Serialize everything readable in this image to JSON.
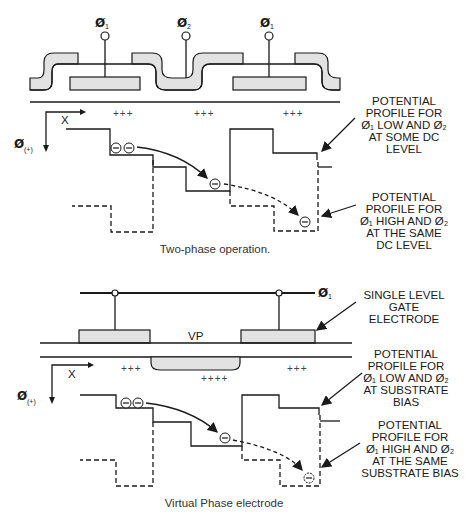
{
  "figure": {
    "top": {
      "caption": "Two-phase operation.",
      "electrodes": [
        {
          "label": "Ø",
          "sub": "1"
        },
        {
          "label": "Ø",
          "sub": "2"
        },
        {
          "label": "Ø",
          "sub": "1"
        }
      ],
      "charges": [
        "+++",
        "+++",
        "+++"
      ],
      "axis": {
        "x_label": "X",
        "y_label": "Ø",
        "y_sub": "(+)"
      },
      "annotations": [
        {
          "lines": [
            "POTENTIAL",
            "PROFILE FOR",
            "Ø₁ LOW AND Ø₂",
            "AT SOME DC",
            "LEVEL"
          ]
        },
        {
          "lines": [
            "POTENTIAL",
            "PROFILE FOR",
            "Ø₁ HIGH AND Ø₂",
            "AT THE SAME",
            "DC LEVEL"
          ]
        }
      ],
      "electron_symbol": "⊖"
    },
    "bottom": {
      "caption": "Virtual Phase electrode",
      "clock": {
        "label": "Ø",
        "sub": "1"
      },
      "vp_label": "VP",
      "charges": [
        "+++",
        "++++",
        "+++"
      ],
      "axis": {
        "x_label": "X",
        "y_label": "Ø",
        "y_sub": "(+)"
      },
      "annotations": [
        {
          "lines": [
            "SINGLE LEVEL",
            "GATE",
            "ELECTRODE"
          ]
        },
        {
          "lines": [
            "POTENTIAL",
            "PROFILE FOR",
            "Ø₁ LOW AND Ø₂",
            "AT SUBSTRATE",
            "BIAS"
          ]
        },
        {
          "lines": [
            "POTENTIAL",
            "PROFILE FOR",
            "Ø₁ HIGH AND Ø₂",
            "AT THE SAME",
            "SUBSTRATE BIAS"
          ]
        }
      ],
      "electron_symbol": "⊖"
    },
    "colors": {
      "line": "#1a1a1a",
      "gate_fill": "#e2e2e2",
      "background": "#ffffff"
    }
  }
}
